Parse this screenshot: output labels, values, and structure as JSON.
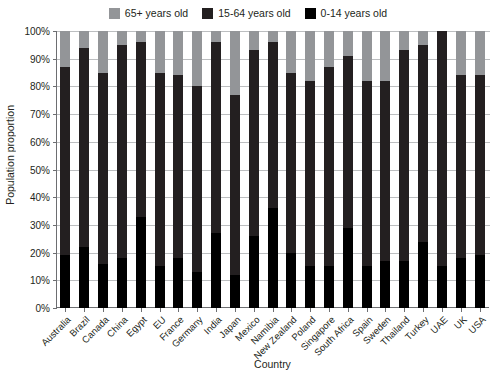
{
  "chart_data": {
    "type": "bar",
    "subtype": "stacked-bar-100-percent",
    "title": "",
    "xlabel": "Country",
    "ylabel": "Population proportion",
    "ylim": [
      0,
      100
    ],
    "ytick_labels": [
      "0%",
      "10%",
      "20%",
      "30%",
      "40%",
      "50%",
      "60%",
      "70%",
      "80%",
      "90%",
      "100%"
    ],
    "ytick_values": [
      0,
      10,
      20,
      30,
      40,
      50,
      60,
      70,
      80,
      90,
      100
    ],
    "grid": true,
    "legend_position": "top-center",
    "stack_order_bottom_to_top": [
      "0-14 years old",
      "15-64 years old",
      "65+ years old"
    ],
    "categories": [
      "Australia",
      "Brazil",
      "Canada",
      "China",
      "Egypt",
      "EU",
      "France",
      "Germany",
      "India",
      "Japan",
      "Mexico",
      "Namibia",
      "New Zealand",
      "Poland",
      "Singapore",
      "South Africa",
      "Spain",
      "Sweden",
      "Thailand",
      "Turkey",
      "UAE",
      "UK",
      "USA"
    ],
    "series": [
      {
        "name": "0-14 years old",
        "color": "#000000",
        "values": [
          19,
          22,
          16,
          18,
          33,
          15,
          18,
          13,
          27,
          12,
          26,
          36,
          20,
          15,
          15,
          29,
          15,
          17,
          17,
          24,
          15,
          18,
          19
        ]
      },
      {
        "name": "15-64 years old",
        "color": "#231f20",
        "values": [
          68,
          72,
          69,
          77,
          63,
          70,
          66,
          67,
          69,
          65,
          67,
          60,
          65,
          67,
          72,
          62,
          67,
          65,
          76,
          71,
          85,
          66,
          65
        ]
      },
      {
        "name": "65+ years old",
        "color": "#939598",
        "values": [
          13,
          6,
          15,
          5,
          4,
          15,
          16,
          20,
          4,
          23,
          7,
          4,
          15,
          18,
          13,
          9,
          18,
          18,
          7,
          5,
          0,
          16,
          16
        ]
      }
    ],
    "cumulative_top_of_working_age": [
      87,
      94,
      85,
      95,
      96,
      85,
      84,
      80,
      96,
      77,
      93,
      96,
      85,
      82,
      87,
      91,
      82,
      82,
      93,
      95,
      100,
      84,
      84
    ]
  },
  "legend": {
    "entries": [
      {
        "label": "65+ years old",
        "color": "#939598"
      },
      {
        "label": "15-64 years old",
        "color": "#231f20"
      },
      {
        "label": "0-14 years old",
        "color": "#000000"
      }
    ]
  }
}
